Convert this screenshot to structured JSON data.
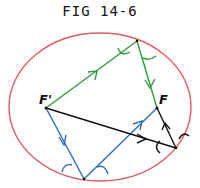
{
  "figure": {
    "title": "FIG 14-6",
    "labels": {
      "focus_left": "F'",
      "focus_right": "F"
    }
  },
  "colors": {
    "ellipse": "#e8585e",
    "green_path": "#2e9e3e",
    "blue_path": "#2a6cc4",
    "black_path": "#111111"
  },
  "geometry": {
    "ellipse": {
      "cx": 100,
      "cy": 107,
      "rx": 91,
      "ry": 74
    },
    "points": {
      "F_prime": [
        46,
        108
      ],
      "F": [
        157,
        108
      ],
      "top_reflection": [
        137,
        41
      ],
      "bottom_reflection": [
        84,
        179
      ],
      "right_reflection": [
        176,
        148
      ]
    },
    "paths": [
      {
        "name": "green",
        "from": "F_prime",
        "via": "top_reflection",
        "to": "F"
      },
      {
        "name": "blue",
        "from": "F_prime",
        "via": "bottom_reflection",
        "to": "F"
      },
      {
        "name": "black",
        "from": "F_prime",
        "via": "right_reflection",
        "to": "F"
      }
    ]
  }
}
